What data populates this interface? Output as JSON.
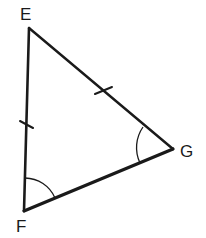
{
  "diagram": {
    "type": "triangle",
    "colors": {
      "stroke": "#1a1a1a",
      "background": "#ffffff"
    },
    "vertices": [
      {
        "id": "E",
        "label": "E",
        "x": 29,
        "y": 28,
        "label_x": 20,
        "label_y": 20
      },
      {
        "id": "F",
        "label": "F",
        "x": 24,
        "y": 211,
        "label_x": 16,
        "label_y": 232
      },
      {
        "id": "G",
        "label": "G",
        "x": 173,
        "y": 149,
        "label_x": 180,
        "label_y": 157
      }
    ],
    "sides": [
      {
        "from": "E",
        "to": "F",
        "tick_marks": 1
      },
      {
        "from": "E",
        "to": "G",
        "tick_marks": 1
      },
      {
        "from": "F",
        "to": "G",
        "tick_marks": 0
      }
    ],
    "congruent_sides": [
      "EF",
      "EG"
    ],
    "congruent_angles": [
      "F",
      "G"
    ]
  }
}
